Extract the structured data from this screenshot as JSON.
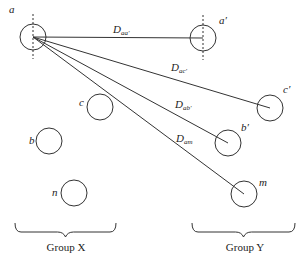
{
  "diagram": {
    "colors": {
      "stroke": "#333333",
      "text": "#222222",
      "background": "#ffffff"
    },
    "conductors": [
      {
        "id": "a",
        "label": "a",
        "group": "X",
        "cx": 33,
        "cy": 37,
        "r": 13,
        "label_x": 9,
        "label_y": 13,
        "dashed_axis": true
      },
      {
        "id": "c",
        "label": "c",
        "group": "X",
        "cx": 100,
        "cy": 107,
        "r": 13,
        "label_x": 79,
        "label_y": 106
      },
      {
        "id": "b",
        "label": "b",
        "group": "X",
        "cx": 49,
        "cy": 141,
        "r": 13,
        "label_x": 29,
        "label_y": 144
      },
      {
        "id": "n",
        "label": "n",
        "group": "X",
        "cx": 74,
        "cy": 193,
        "r": 13,
        "label_x": 52,
        "label_y": 196
      },
      {
        "id": "a_prime",
        "label": "a′",
        "group": "Y",
        "cx": 203,
        "cy": 38,
        "r": 13,
        "label_x": 219,
        "label_y": 24,
        "dashed_axis": true
      },
      {
        "id": "c_prime",
        "label": "c′",
        "group": "Y",
        "cx": 270,
        "cy": 108,
        "r": 13,
        "label_x": 283,
        "label_y": 93
      },
      {
        "id": "b_prime",
        "label": "b′",
        "group": "Y",
        "cx": 228,
        "cy": 143,
        "r": 13,
        "label_x": 241,
        "label_y": 131
      },
      {
        "id": "m",
        "label": "m",
        "group": "Y",
        "cx": 244,
        "cy": 194,
        "r": 13,
        "label_x": 259,
        "label_y": 186
      }
    ],
    "distances": [
      {
        "label_main": "D",
        "label_sub": "aa′",
        "from": "a",
        "to": "a_prime",
        "x1": 33,
        "y1": 37,
        "x2": 203,
        "y2": 38,
        "label_x": 113,
        "label_y": 33
      },
      {
        "label_main": "D",
        "label_sub": "ac′",
        "from": "a",
        "to": "c_prime",
        "x1": 33,
        "y1": 37,
        "x2": 270,
        "y2": 108,
        "label_x": 171,
        "label_y": 71
      },
      {
        "label_main": "D",
        "label_sub": "ab′",
        "from": "a",
        "to": "b_prime",
        "x1": 33,
        "y1": 37,
        "x2": 228,
        "y2": 143,
        "label_x": 175,
        "label_y": 108
      },
      {
        "label_main": "D",
        "label_sub": "am",
        "from": "a",
        "to": "m",
        "x1": 33,
        "y1": 37,
        "x2": 244,
        "y2": 194,
        "label_x": 176,
        "label_y": 142
      }
    ],
    "groups": [
      {
        "id": "X",
        "label": "Group X",
        "brace_x1": 15,
        "brace_x2": 116,
        "brace_y": 223,
        "text_x": 66,
        "text_y": 251
      },
      {
        "id": "Y",
        "label": "Group Y",
        "brace_x1": 192,
        "brace_x2": 295,
        "brace_y": 223,
        "text_x": 245,
        "text_y": 251
      }
    ]
  }
}
